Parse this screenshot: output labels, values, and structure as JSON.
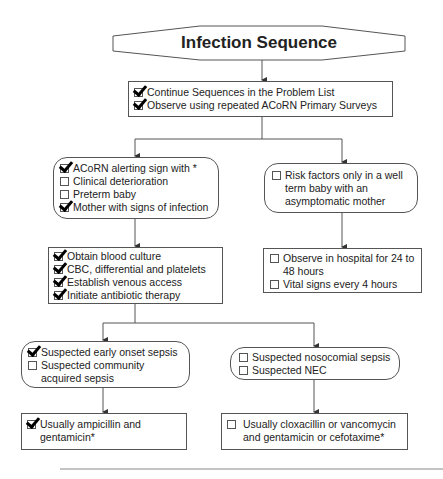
{
  "title": "Infection Sequence",
  "top_box": {
    "items": [
      {
        "label": "Continue Sequences in the Problem List",
        "checked": true
      },
      {
        "label": "Observe using repeated ACoRN Primary Surveys",
        "checked": true
      }
    ]
  },
  "left_branch": {
    "alert_box": {
      "items": [
        {
          "label": "ACoRN alerting sign with *",
          "checked": true
        },
        {
          "label": "Clinical deterioration",
          "checked": false
        },
        {
          "label": "Preterm baby",
          "checked": false
        },
        {
          "label": "Mother with signs of infection",
          "checked": true
        }
      ]
    },
    "actions_box": {
      "items": [
        {
          "label": "Obtain blood culture",
          "checked": true
        },
        {
          "label": "CBC, differential and platelets",
          "checked": true
        },
        {
          "label": "Establish venous access",
          "checked": true
        },
        {
          "label": "Initiate antibiotic therapy",
          "checked": true
        }
      ]
    }
  },
  "right_branch": {
    "risk_box": {
      "line1": "Risk factors only in a well",
      "line2": "term baby with an",
      "line3": "asymptomatic mother",
      "checked": false
    },
    "observe_box": {
      "item1_line1": "Observe in hospital for 24 to",
      "item1_line2": "48 hours",
      "item2": "Vital signs every 4 hours"
    }
  },
  "sepsis_left": {
    "item1": "Suspected early onset sepsis",
    "item2_line1": "Suspected community",
    "item2_line2": "acquired sepsis"
  },
  "sepsis_right": {
    "item1": "Suspected nosocomial sepsis",
    "item2": "Suspected NEC"
  },
  "treatment_left": {
    "line1": "Usually ampicillin and",
    "line2": "gentamicin*"
  },
  "treatment_right": {
    "line1": "Usually cloxacillin or vancomycin",
    "line2": "and gentamicin or cefotaxime*"
  },
  "colors": {
    "line": "#555555",
    "text": "#222222",
    "background": "#ffffff"
  }
}
